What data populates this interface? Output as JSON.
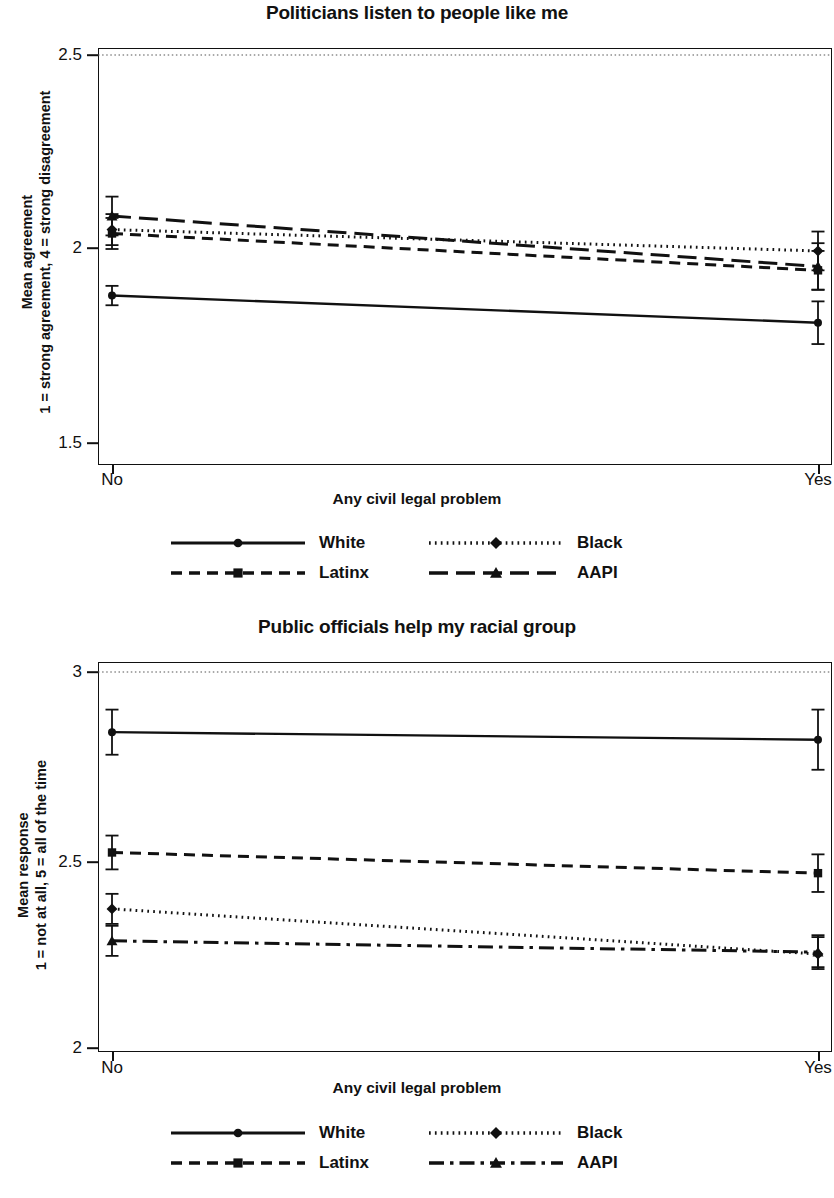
{
  "figure": {
    "x_axis_title": "Any civil legal problem",
    "x_categories": [
      "No",
      "Yes"
    ],
    "series_names": [
      "White",
      "Black",
      "Latinx",
      "AAPI"
    ]
  },
  "panel1": {
    "title": "Politicians listen to people like me",
    "ylabel_line1": "Mean agreement",
    "ylabel_line2": "1 = strong agreement, 4 = strong disagreement",
    "xlabel": "Any civil legal problem",
    "yticks": [
      "1.5",
      "2",
      "2.5"
    ],
    "xticks": [
      "No",
      "Yes"
    ],
    "legend": [
      {
        "name": "White",
        "style": "solid"
      },
      {
        "name": "Black",
        "style": "dotted"
      },
      {
        "name": "Latinx",
        "style": "dashed"
      },
      {
        "name": "AAPI",
        "style": "longdash"
      }
    ]
  },
  "panel2": {
    "title": "Public officials help my racial group",
    "ylabel_line1": "Mean response",
    "ylabel_line2": "1 = not at all, 5 = all of the time",
    "xlabel": "Any civil legal problem",
    "yticks": [
      "2",
      "2.5",
      "3"
    ],
    "xticks": [
      "No",
      "Yes"
    ],
    "legend": [
      {
        "name": "White",
        "style": "solid"
      },
      {
        "name": "Black",
        "style": "dotted"
      },
      {
        "name": "Latinx",
        "style": "dashed"
      },
      {
        "name": "AAPI",
        "style": "dashdot"
      }
    ]
  },
  "chart_data": [
    {
      "type": "line",
      "panel": "panel1",
      "title": "Politicians listen to people like me",
      "xlabel": "Any civil legal problem",
      "ylabel": "Mean agreement (1 = strong agreement, 4 = strong disagreement)",
      "categories": [
        "No",
        "Yes"
      ],
      "ylim": [
        1.5,
        2.5
      ],
      "yticks": [
        1.5,
        2.0,
        2.5
      ],
      "grid": false,
      "reference_line": {
        "y": 2.5,
        "style": "dotted"
      },
      "legend_position": "below",
      "series": [
        {
          "name": "White",
          "line": "solid",
          "marker": "circle",
          "values": [
            1.88,
            1.81
          ],
          "ci_low": [
            1.855,
            1.755
          ],
          "ci_high": [
            1.905,
            1.865
          ]
        },
        {
          "name": "Black",
          "line": "dotted",
          "marker": "diamond",
          "values": [
            2.05,
            1.995
          ],
          "ci_low": [
            2.01,
            1.945
          ],
          "ci_high": [
            2.09,
            2.045
          ]
        },
        {
          "name": "Latinx",
          "line": "dashed",
          "marker": "square",
          "values": [
            2.04,
            1.945
          ],
          "ci_low": [
            2.0,
            1.895
          ],
          "ci_high": [
            2.08,
            1.995
          ]
        },
        {
          "name": "AAPI",
          "line": "longdash",
          "marker": "triangle",
          "values": [
            2.085,
            1.955
          ],
          "ci_low": [
            2.035,
            1.895
          ],
          "ci_high": [
            2.135,
            2.015
          ]
        }
      ]
    },
    {
      "type": "line",
      "panel": "panel2",
      "title": "Public officials help my racial group",
      "xlabel": "Any civil legal problem",
      "ylabel": "Mean response (1 = not at all, 5 = all of the time)",
      "categories": [
        "No",
        "Yes"
      ],
      "ylim": [
        2.0,
        3.0
      ],
      "yticks": [
        2.0,
        2.5,
        3.0
      ],
      "grid": false,
      "reference_line": {
        "y": 3.0,
        "style": "dotted"
      },
      "legend_position": "below",
      "series": [
        {
          "name": "White",
          "line": "solid",
          "marker": "circle",
          "values": [
            2.84,
            2.82
          ],
          "ci_low": [
            2.78,
            2.74
          ],
          "ci_high": [
            2.9,
            2.9
          ]
        },
        {
          "name": "Black",
          "line": "dotted",
          "marker": "diamond",
          "values": [
            2.37,
            2.25
          ],
          "ci_low": [
            2.33,
            2.21
          ],
          "ci_high": [
            2.41,
            2.3
          ]
        },
        {
          "name": "Latinx",
          "line": "dashed",
          "marker": "square",
          "values": [
            2.52,
            2.465
          ],
          "ci_low": [
            2.475,
            2.415
          ],
          "ci_high": [
            2.565,
            2.515
          ]
        },
        {
          "name": "AAPI",
          "line": "dashdot",
          "marker": "triangle",
          "values": [
            2.285,
            2.255
          ],
          "ci_low": [
            2.245,
            2.215
          ],
          "ci_high": [
            2.325,
            2.295
          ]
        }
      ]
    }
  ]
}
